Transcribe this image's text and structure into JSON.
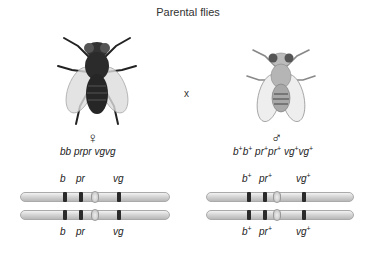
{
  "title": "Parental flies",
  "cross_symbol": "x",
  "female": {
    "sex_symbol": "♀",
    "genotype_parts": [
      "bb",
      "prpr",
      "vgvg"
    ],
    "genotype": "bb prpr vgvg",
    "fly_color": "#2b2b2b",
    "chromosomes": [
      {
        "labels": [
          "b",
          "pr",
          "vg"
        ]
      },
      {
        "labels": [
          "b",
          "pr",
          "vg"
        ]
      }
    ]
  },
  "male": {
    "sex_symbol": "♂",
    "genotype": "b+b+ pr+pr+ vg+vg+",
    "fly_color": "#9a9a9a",
    "chromosomes": [
      {
        "labels": [
          "b+",
          "pr+",
          "vg+"
        ]
      },
      {
        "labels": [
          "b+",
          "pr+",
          "vg+"
        ]
      }
    ]
  },
  "gene_labels": {
    "b": "b",
    "pr": "pr",
    "vg": "vg",
    "plus": "+"
  }
}
